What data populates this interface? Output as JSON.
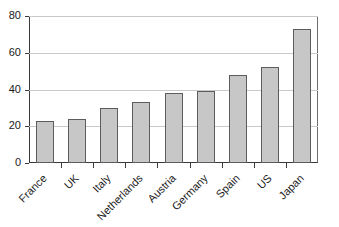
{
  "chart_data": {
    "type": "bar",
    "title": "",
    "xlabel": "",
    "ylabel": "",
    "categories": [
      "France",
      "UK",
      "Italy",
      "Netherlands",
      "Austria",
      "Germany",
      "Spain",
      "US",
      "Japan"
    ],
    "values": [
      23,
      24,
      30,
      33,
      38,
      39,
      48,
      52,
      73
    ],
    "ylim": [
      0,
      80
    ],
    "ytick_labels": [
      "0",
      "20",
      "40",
      "60",
      "80"
    ],
    "ytick_values": [
      0,
      20,
      40,
      60,
      80
    ],
    "grid": true,
    "legend": false,
    "legend_position": "none",
    "series": [
      {
        "name": "",
        "values": [
          23,
          24,
          30,
          33,
          38,
          39,
          48,
          52,
          73
        ]
      }
    ],
    "colors": {
      "bar_fill": "#c7c7c7",
      "bar_edge": "#5c5c5c",
      "axis": "#3a3a3a",
      "gridline": "#c9c9c9",
      "text": "#1a1a1a",
      "background": "#ffffff"
    }
  }
}
